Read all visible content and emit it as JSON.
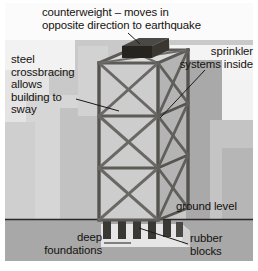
{
  "figure": {
    "width": 258,
    "height": 271
  },
  "labels": {
    "counterweight": "counterweight – moves in\nopposite direction to earthquake",
    "steel_crossbracing": "steel\ncrossbracing\nallows\nbuilding to\nsway",
    "sprinkler": "sprinkler\nsystems inside",
    "ground_level": "ground level",
    "rubber_blocks": "rubber\nblocks",
    "deep_foundations": "deep\nfoundations"
  },
  "colors": {
    "page_background": "#ffffff",
    "sky_background": "#c9c9c9",
    "backdrop_building_light": "#d8d8d8",
    "backdrop_building_pale": "#e3e3e3",
    "backdrop_building_dark": "#a9a9a9",
    "ground_fill": "#a8a8a8",
    "ground_line": "#2a2724",
    "tower_face_light": "#d0d0d0",
    "tower_face_mid": "#bdbdbd",
    "tower_face_dark": "#a6a6a6",
    "steel_member": "#6e6c6a",
    "steel_member_dark": "#4c4a48",
    "counterweight_top": "#4b4946",
    "counterweight_front": "#26241f",
    "counterweight_side": "#39372f",
    "foundation_slab": "#e6e6e6",
    "rubber_block": "#3a3835",
    "leader_line": "#1b1815",
    "text": "#15120f"
  },
  "diagram_parts": [
    {
      "name": "counterweight",
      "description": "dark rectangular block sitting on the tower roof"
    },
    {
      "name": "tower",
      "description": "steel-framed skyscraper drawn in isometric view with X crossbracing"
    },
    {
      "name": "ground-line",
      "description": "horizontal line separating sky from sub-surface"
    },
    {
      "name": "rubber-blocks",
      "description": "row of dark vertical blocks under the tower base"
    },
    {
      "name": "deep-foundations",
      "description": "pale slab embedded below ground level"
    },
    {
      "name": "backdrop-buildings",
      "description": "flat grey silhouettes of neighbouring buildings"
    }
  ]
}
